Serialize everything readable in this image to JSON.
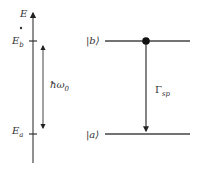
{
  "energy_axis": {
    "label": "E",
    "tick_upper_label": "E",
    "tick_upper_sub": "b",
    "tick_lower_label": "E",
    "tick_lower_sub": "a"
  },
  "transition_energy": {
    "label": "ħω",
    "sub": "0"
  },
  "levels": {
    "upper": {
      "label": "|b⟩"
    },
    "lower": {
      "label": "|a⟩"
    }
  },
  "decay": {
    "label": "Γ",
    "sub": "sp"
  },
  "colors": {
    "line": "#555555",
    "dot": "#111111",
    "text": "#333333"
  }
}
